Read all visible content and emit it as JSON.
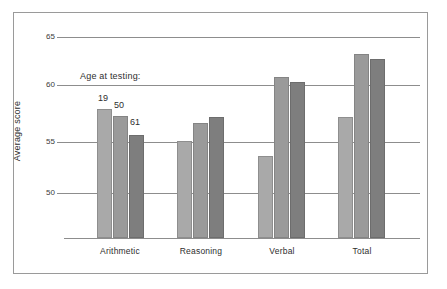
{
  "chart_data": {
    "type": "bar",
    "title": "",
    "xlabel": "",
    "ylabel": "Average score",
    "ylim": [
      47.2,
      66.5
    ],
    "yticks": [
      50,
      55,
      60,
      65
    ],
    "grid": true,
    "legend_title": "Age at testing:",
    "legend_position": "above-first-group",
    "categories": [
      "Arithmetic",
      "Reasoning",
      "Verbal",
      "Total"
    ],
    "series": [
      {
        "name": "19",
        "values": [
          58.3,
          55.5,
          54.2,
          57.6
        ]
      },
      {
        "name": "50",
        "values": [
          57.7,
          57.1,
          61.0,
          63.0
        ]
      },
      {
        "name": "61",
        "values": [
          56.0,
          57.6,
          60.6,
          62.6
        ]
      }
    ],
    "series_colors": [
      "#a9a9a9",
      "#9a9a9a",
      "#7e7e7e"
    ],
    "annotations": [
      "19",
      "50",
      "61"
    ]
  }
}
